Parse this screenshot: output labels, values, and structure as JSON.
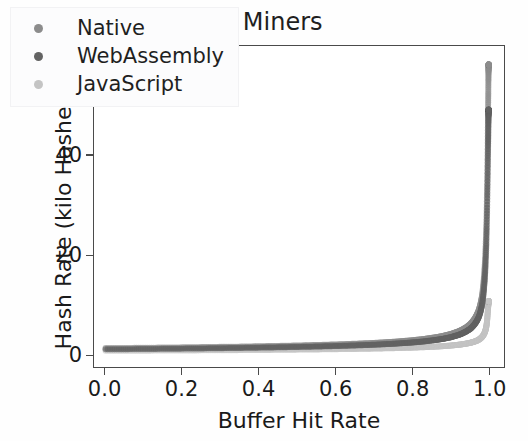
{
  "chart_data": {
    "type": "scatter",
    "title": "All Miners",
    "xlabel": "Buffer Hit Rate",
    "ylabel": "Hash Rate (kilo Hashes/s)",
    "xlim": [
      -0.03,
      1.04
    ],
    "ylim": [
      -2.5,
      62
    ],
    "xticks": [
      "0.0",
      "0.2",
      "0.4",
      "0.6",
      "0.8",
      "1.0"
    ],
    "xtick_values": [
      0.0,
      0.2,
      0.4,
      0.6,
      0.8,
      1.0
    ],
    "yticks": [
      "0",
      "20",
      "40",
      "60"
    ],
    "ytick_values": [
      0,
      20,
      40,
      60
    ],
    "grid": false,
    "legend_position": "upper left",
    "legend_entries": [
      "Native",
      "WebAssembly",
      "JavaScript"
    ],
    "series": [
      {
        "name": "Native",
        "color": "#8c8c8c",
        "x": [
          0.0,
          0.05,
          0.1,
          0.15,
          0.2,
          0.25,
          0.3,
          0.35,
          0.4,
          0.45,
          0.5,
          0.55,
          0.6,
          0.65,
          0.7,
          0.75,
          0.8,
          0.83,
          0.86,
          0.88,
          0.9,
          0.92,
          0.93,
          0.94,
          0.95,
          0.955,
          0.96,
          0.965,
          0.97,
          0.973,
          0.976,
          0.979,
          0.982,
          0.984,
          0.986,
          0.988,
          0.99,
          0.991,
          0.992,
          0.993,
          0.994,
          0.995,
          0.996,
          0.9965,
          0.997,
          0.9975,
          0.998,
          0.9985,
          0.999,
          0.9993,
          0.9996,
          1.0
        ],
        "y": [
          1.3,
          1.33,
          1.37,
          1.41,
          1.45,
          1.5,
          1.55,
          1.6,
          1.67,
          1.74,
          1.82,
          1.92,
          2.03,
          2.17,
          2.34,
          2.56,
          2.87,
          3.12,
          3.45,
          3.72,
          4.1,
          4.62,
          4.98,
          5.42,
          6.0,
          6.38,
          6.85,
          7.42,
          8.15,
          8.7,
          9.4,
          10.3,
          11.5,
          12.6,
          14.0,
          15.8,
          18.2,
          19.7,
          21.5,
          23.8,
          26.5,
          30.0,
          34.5,
          37.2,
          40.0,
          43.0,
          46.2,
          49.5,
          52.5,
          54.8,
          56.8,
          58.3
        ]
      },
      {
        "name": "WebAssembly",
        "color": "#636363",
        "x": [
          0.0,
          0.05,
          0.1,
          0.15,
          0.2,
          0.25,
          0.3,
          0.35,
          0.4,
          0.45,
          0.5,
          0.55,
          0.6,
          0.65,
          0.7,
          0.75,
          0.8,
          0.83,
          0.86,
          0.88,
          0.9,
          0.92,
          0.93,
          0.94,
          0.95,
          0.955,
          0.96,
          0.965,
          0.97,
          0.973,
          0.976,
          0.979,
          0.982,
          0.984,
          0.986,
          0.988,
          0.99,
          0.991,
          0.992,
          0.993,
          0.994,
          0.995,
          0.996,
          0.9965,
          0.997,
          0.9975,
          0.998,
          0.9985,
          0.999,
          0.9993,
          0.9996,
          1.0
        ],
        "y": [
          1.05,
          1.08,
          1.11,
          1.15,
          1.19,
          1.23,
          1.28,
          1.33,
          1.39,
          1.45,
          1.53,
          1.61,
          1.71,
          1.83,
          1.97,
          2.16,
          2.42,
          2.63,
          2.91,
          3.14,
          3.46,
          3.9,
          4.2,
          4.58,
          5.06,
          5.38,
          5.78,
          6.26,
          6.88,
          7.34,
          7.93,
          8.69,
          9.7,
          10.63,
          11.81,
          13.33,
          15.35,
          16.62,
          18.14,
          20.08,
          22.35,
          25.3,
          29.1,
          31.4,
          33.75,
          36.3,
          39.0,
          41.8,
          44.3,
          46.2,
          47.9,
          49.2
        ]
      },
      {
        "name": "JavaScript",
        "color": "#c4c4c4",
        "x": [
          0.0,
          0.05,
          0.1,
          0.15,
          0.2,
          0.25,
          0.3,
          0.35,
          0.4,
          0.45,
          0.5,
          0.55,
          0.6,
          0.65,
          0.7,
          0.75,
          0.8,
          0.83,
          0.86,
          0.88,
          0.9,
          0.92,
          0.93,
          0.94,
          0.95,
          0.955,
          0.96,
          0.965,
          0.97,
          0.973,
          0.976,
          0.979,
          0.982,
          0.984,
          0.986,
          0.988,
          0.99,
          0.991,
          0.992,
          0.993,
          0.994,
          0.995,
          0.996,
          0.9965,
          0.997,
          0.9975,
          0.998,
          0.9985,
          0.999,
          0.9993,
          0.9996,
          1.0
        ],
        "y": [
          0.75,
          0.76,
          0.78,
          0.8,
          0.82,
          0.84,
          0.86,
          0.89,
          0.92,
          0.95,
          0.99,
          1.03,
          1.08,
          1.13,
          1.2,
          1.28,
          1.39,
          1.48,
          1.59,
          1.68,
          1.8,
          1.96,
          2.06,
          2.18,
          2.33,
          2.42,
          2.53,
          2.66,
          2.82,
          2.94,
          3.08,
          3.26,
          3.48,
          3.66,
          3.88,
          4.15,
          4.5,
          4.72,
          4.98,
          5.3,
          5.7,
          6.2,
          6.9,
          7.35,
          7.85,
          8.4,
          8.95,
          9.5,
          9.95,
          10.25,
          10.5,
          10.7
        ]
      }
    ]
  },
  "legend": {
    "items": [
      {
        "label": "Native",
        "color": "#8c8c8c"
      },
      {
        "label": "WebAssembly",
        "color": "#636363"
      },
      {
        "label": "JavaScript",
        "color": "#c4c4c4"
      }
    ]
  },
  "axes": {
    "title": "All Miners",
    "xlabel": "Buffer Hit Rate",
    "ylabel": "Hash Rate (kilo Hashes/s)",
    "xticks": [
      "0.0",
      "0.2",
      "0.4",
      "0.6",
      "0.8",
      "1.0"
    ],
    "yticks": [
      "0",
      "20",
      "40",
      "60"
    ]
  },
  "colors": {
    "native": "#8c8c8c",
    "webassembly": "#636363",
    "javascript": "#c4c4c4",
    "axis": "#4a4a4a",
    "text": "#1a1a1a",
    "background": "#ffffff"
  }
}
